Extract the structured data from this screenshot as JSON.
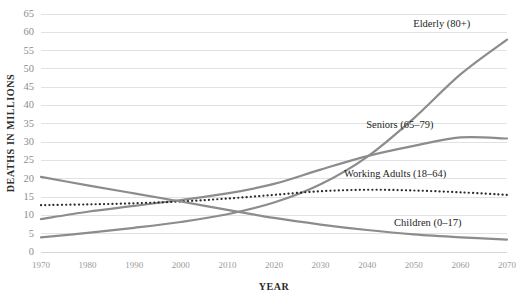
{
  "chart_data": {
    "type": "line",
    "title": "",
    "xlabel": "YEAR",
    "ylabel": "DEATHS IN MILLIONS",
    "x": [
      1970,
      1980,
      1990,
      2000,
      2010,
      2020,
      2030,
      2040,
      2050,
      2060,
      2070
    ],
    "xlim": [
      1970,
      2070
    ],
    "ylim": [
      0,
      65
    ],
    "ytick_step": 5,
    "yticks": [
      0,
      5,
      10,
      15,
      20,
      25,
      30,
      35,
      40,
      45,
      50,
      55,
      60,
      65
    ],
    "xticks": [
      1970,
      1980,
      1990,
      2000,
      2010,
      2020,
      2030,
      2040,
      2050,
      2060,
      2070
    ],
    "grid": true,
    "legend_position": "inline-right",
    "series": [
      {
        "name": "Elderly (80+)",
        "label": "Elderly (80+)",
        "style": "solid",
        "color": "#8c8c8c",
        "width": 2.2,
        "values": [
          4.0,
          5.2,
          6.6,
          8.2,
          10.3,
          13.5,
          18.5,
          26.0,
          36.5,
          48.5,
          58.0
        ],
        "label_x": 2056,
        "label_y": 61.5
      },
      {
        "name": "Seniors (65-79)",
        "label": "Seniors (65–79)",
        "style": "solid",
        "color": "#8c8c8c",
        "width": 2.2,
        "values": [
          9.0,
          11.0,
          12.6,
          14.2,
          16.0,
          18.6,
          22.5,
          26.2,
          29.0,
          31.3,
          31.0
        ],
        "label_x": 2047,
        "label_y": 34.0
      },
      {
        "name": "Working Adults (18-64)",
        "label": "Working Adults (18–64)",
        "style": "dotted",
        "color": "#2b2b2b",
        "width": 2.2,
        "values": [
          12.8,
          13.0,
          13.3,
          13.8,
          14.6,
          15.6,
          16.6,
          17.0,
          16.8,
          16.3,
          15.6
        ],
        "label_x": 2046,
        "label_y": 20.6
      },
      {
        "name": "Children (0-17)",
        "label": "Children (0–17)",
        "style": "solid",
        "color": "#8c8c8c",
        "width": 2.2,
        "values": [
          20.5,
          18.2,
          16.0,
          13.8,
          11.5,
          9.3,
          7.5,
          6.0,
          4.8,
          4.0,
          3.4
        ],
        "label_x": 2053,
        "label_y": 7.2
      }
    ]
  },
  "plot_geometry": {
    "left": 41,
    "right": 507,
    "top": 14,
    "bottom": 252
  }
}
